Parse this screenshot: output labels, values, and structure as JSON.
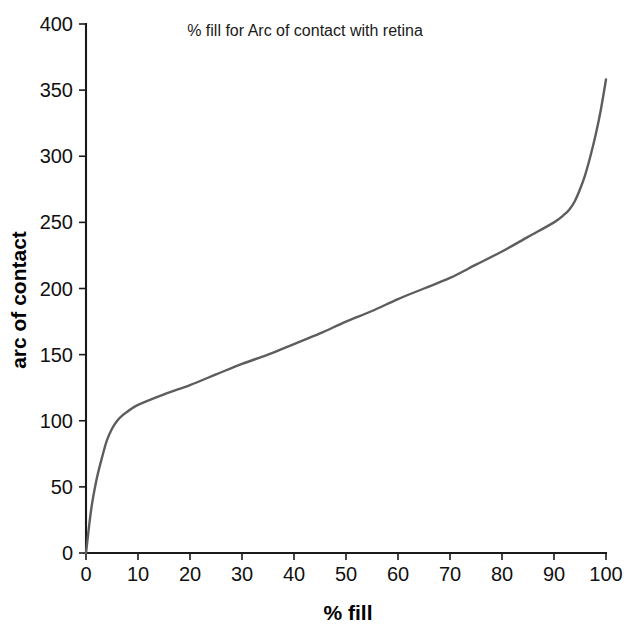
{
  "chart_data": {
    "type": "line",
    "title": "% fill for Arc of contact with retina",
    "xlabel": "% fill",
    "ylabel": "arc of contact",
    "xlim": [
      0,
      100
    ],
    "ylim": [
      0,
      400
    ],
    "xticks": [
      "0",
      "10",
      "20",
      "30",
      "40",
      "50",
      "60",
      "70",
      "80",
      "90",
      "100"
    ],
    "yticks": [
      "0",
      "50",
      "100",
      "150",
      "200",
      "250",
      "300",
      "350",
      "400"
    ],
    "grid": false,
    "legend": null,
    "series": [
      {
        "name": "arc of contact",
        "color": "#5d5d5d",
        "x": [
          0,
          1,
          2,
          3,
          4,
          5,
          6,
          7,
          8,
          10,
          15,
          20,
          25,
          30,
          35,
          40,
          45,
          50,
          55,
          60,
          65,
          70,
          75,
          80,
          85,
          90,
          92,
          93,
          94,
          95,
          96,
          97,
          98,
          99,
          100
        ],
        "values": [
          0,
          33,
          55,
          71,
          85,
          94,
          100,
          104,
          107,
          112,
          120,
          127,
          135,
          143,
          150,
          158,
          166,
          175,
          183,
          192,
          200,
          208,
          218,
          228,
          239,
          250,
          256,
          260,
          266,
          275,
          286,
          300,
          316,
          335,
          358
        ]
      }
    ]
  },
  "axes": {
    "x_tick_values": [
      0,
      10,
      20,
      30,
      40,
      50,
      60,
      70,
      80,
      90,
      100
    ],
    "y_tick_values": [
      0,
      50,
      100,
      150,
      200,
      250,
      300,
      350,
      400
    ]
  },
  "colors": {
    "curve": "#5d5d5d",
    "axis": "#1a1a1a",
    "text": "#000000",
    "background": "#ffffff"
  }
}
